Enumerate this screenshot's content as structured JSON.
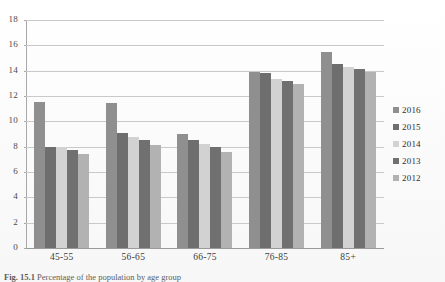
{
  "figure": {
    "caption_prefix": "Fig. 15.1",
    "caption_rest": " Percentage of the population by age group"
  },
  "legend": {
    "position": "right",
    "entries": [
      {
        "label": "2016",
        "color": "#8f8f8f"
      },
      {
        "label": "2015",
        "color": "#6e6e6e"
      },
      {
        "label": "2014",
        "color": "#d2d2d2"
      },
      {
        "label": "2013",
        "color": "#707070"
      },
      {
        "label": "2012",
        "color": "#b2b2b2"
      }
    ]
  },
  "axis": {
    "y_ticks": [
      "18",
      "16",
      "14",
      "12",
      "10",
      "8",
      "6",
      "4",
      "2",
      "0"
    ],
    "x_ticks": [
      "45-55",
      "56-65",
      "66-75",
      "76-85",
      "85+"
    ]
  },
  "chart_data": {
    "type": "bar",
    "title": "",
    "xlabel": "",
    "ylabel": "",
    "ylim": [
      0,
      18
    ],
    "ytick_step": 2,
    "grid": true,
    "legend_position": "right",
    "categories": [
      "45-55",
      "56-65",
      "66-75",
      "76-85",
      "85+"
    ],
    "series": [
      {
        "name": "2016",
        "color": "#8f8f8f",
        "values": [
          11.55,
          11.45,
          9.0,
          13.9,
          15.5
        ]
      },
      {
        "name": "2015",
        "color": "#6e6e6e",
        "values": [
          8.0,
          9.1,
          8.55,
          13.8,
          14.5
        ]
      },
      {
        "name": "2014",
        "color": "#d2d2d2",
        "values": [
          8.0,
          8.75,
          8.25,
          13.35,
          14.3
        ]
      },
      {
        "name": "2013",
        "color": "#707070",
        "values": [
          7.7,
          8.55,
          7.95,
          13.15,
          14.1
        ]
      },
      {
        "name": "2012",
        "color": "#b2b2b2",
        "values": [
          7.4,
          8.1,
          7.55,
          12.95,
          13.9
        ]
      }
    ]
  }
}
